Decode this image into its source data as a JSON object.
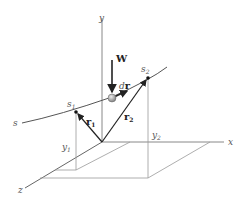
{
  "diagram": {
    "axes": {
      "x": "x",
      "y": "y",
      "z": "z"
    },
    "path_label": "s",
    "points": {
      "s1": {
        "base": "s",
        "sub": "1"
      },
      "s2": {
        "base": "s",
        "sub": "2"
      }
    },
    "vectors": {
      "r1": {
        "base": "r",
        "sub": "1"
      },
      "r2": {
        "base": "r",
        "sub": "2"
      },
      "dr": {
        "prefix": "d",
        "base": "r"
      },
      "W": "W"
    },
    "heights": {
      "y1": {
        "base": "y",
        "sub": "1"
      },
      "y2": {
        "base": "y",
        "sub": "2"
      }
    },
    "colors": {
      "axis": "#888888",
      "vector": "#222222",
      "particle": "#aaaaaa"
    }
  }
}
